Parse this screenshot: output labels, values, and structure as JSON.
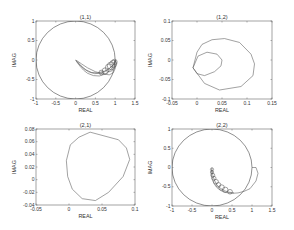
{
  "figure": {
    "width": 294,
    "height": 230,
    "background": "#ffffff",
    "line_color": "#555555"
  },
  "chart_data": [
    {
      "id": "p11",
      "type": "line",
      "title": "(1,1)",
      "xlabel": "REAL",
      "ylabel": "IMAG",
      "xlim": [
        -1,
        1.5
      ],
      "ylim": [
        -1,
        1
      ],
      "xticks": [
        -1,
        -0.5,
        0,
        0.5,
        1,
        1.5
      ],
      "xtick_labels": [
        "-1",
        "-0.5",
        "0",
        "0.5",
        "1",
        "1.5"
      ],
      "yticks": [
        -1,
        -0.5,
        0,
        0.5,
        1
      ],
      "ytick_labels": [
        "-1",
        "-0.5",
        "0",
        "0.5",
        "1"
      ],
      "grid": false,
      "box": {
        "left": 36,
        "top": 21,
        "right": 135,
        "bottom": 99
      },
      "unit_circle": true,
      "series": [
        {
          "name": "loci",
          "x": [
            0.0,
            0.05,
            0.12,
            0.2,
            0.3,
            0.45,
            0.6,
            0.75,
            0.88,
            0.97,
            1.0,
            1.02,
            1.0,
            0.95,
            0.85,
            0.7,
            0.5,
            0.3,
            0.15,
            0.05,
            0.0
          ],
          "y": [
            0.0,
            -0.08,
            -0.17,
            -0.26,
            -0.34,
            -0.4,
            -0.41,
            -0.36,
            -0.26,
            -0.13,
            0.0,
            -0.1,
            -0.22,
            -0.33,
            -0.38,
            -0.36,
            -0.3,
            -0.2,
            -0.1,
            -0.03,
            0.0
          ]
        },
        {
          "name": "loci-2",
          "x": [
            0.02,
            0.1,
            0.2,
            0.32,
            0.48,
            0.63,
            0.78,
            0.9,
            0.98,
            1.0
          ],
          "y": [
            -0.02,
            -0.12,
            -0.22,
            -0.3,
            -0.35,
            -0.34,
            -0.28,
            -0.18,
            -0.07,
            0.0
          ]
        },
        {
          "name": "loci-3",
          "x": [
            0.04,
            0.14,
            0.26,
            0.4,
            0.56,
            0.72,
            0.86,
            0.96,
            1.01
          ],
          "y": [
            -0.04,
            -0.15,
            -0.25,
            -0.32,
            -0.33,
            -0.29,
            -0.21,
            -0.11,
            -0.03
          ]
        }
      ],
      "small_circles": [
        {
          "cx": 0.85,
          "cy": -0.2,
          "r": 0.1
        },
        {
          "cx": 0.9,
          "cy": -0.15,
          "r": 0.1
        },
        {
          "cx": 0.95,
          "cy": -0.1,
          "r": 0.09
        },
        {
          "cx": 0.98,
          "cy": -0.05,
          "r": 0.07
        },
        {
          "cx": 0.75,
          "cy": -0.28,
          "r": 0.08
        },
        {
          "cx": 0.65,
          "cy": -0.32,
          "r": 0.06
        }
      ]
    },
    {
      "id": "p12",
      "type": "line",
      "title": "(1,2)",
      "xlabel": "REAL",
      "ylabel": "IMAG",
      "xlim": [
        -0.05,
        0.15
      ],
      "ylim": [
        -0.1,
        0.1
      ],
      "xticks": [
        -0.05,
        0,
        0.05,
        0.1,
        0.15
      ],
      "xtick_labels": [
        "-0.05",
        "0",
        "0.05",
        "0.1",
        "0.15"
      ],
      "yticks": [
        -0.1,
        -0.05,
        0,
        0.05,
        0.1
      ],
      "ytick_labels": [
        "-0.1",
        "-0.05",
        "0",
        "0.05",
        "0.1"
      ],
      "grid": false,
      "box": {
        "left": 172,
        "top": 21,
        "right": 272,
        "bottom": 99
      },
      "unit_circle": false,
      "series": [
        {
          "name": "outer-loop",
          "x": [
            -0.008,
            0.0,
            0.01,
            0.03,
            0.055,
            0.085,
            0.108,
            0.115,
            0.112,
            0.088,
            0.045,
            0.015,
            -0.008
          ],
          "y": [
            -0.02,
            0.02,
            0.04,
            0.052,
            0.055,
            0.045,
            0.015,
            -0.01,
            -0.04,
            -0.068,
            -0.077,
            -0.06,
            -0.02
          ]
        },
        {
          "name": "inner-loop",
          "x": [
            -0.008,
            0.002,
            0.02,
            0.04,
            0.05,
            0.048,
            0.035,
            0.015,
            0.0,
            -0.008
          ],
          "y": [
            -0.02,
            0.01,
            0.02,
            0.015,
            0.0,
            -0.015,
            -0.03,
            -0.04,
            -0.035,
            -0.02
          ]
        }
      ]
    },
    {
      "id": "p21",
      "type": "line",
      "title": "(2,1)",
      "xlabel": "REAL",
      "ylabel": "IMAG",
      "xlim": [
        -0.05,
        0.1
      ],
      "ylim": [
        -0.04,
        0.08
      ],
      "xticks": [
        -0.05,
        0,
        0.05,
        0.1
      ],
      "xtick_labels": [
        "-0.05",
        "0",
        "0.05",
        "0.1"
      ],
      "yticks": [
        -0.04,
        -0.02,
        0,
        0.02,
        0.04,
        0.06,
        0.08
      ],
      "ytick_labels": [
        "-0.04",
        "-0.02",
        "0",
        "0.02",
        "0.04",
        "0.06",
        "0.08"
      ],
      "grid": false,
      "box": {
        "left": 36,
        "top": 129,
        "right": 135,
        "bottom": 205
      },
      "unit_circle": false,
      "series": [
        {
          "name": "locus",
          "x": [
            0.002,
            0.015,
            0.032,
            0.075,
            0.087,
            0.092,
            0.082,
            0.06,
            0.04,
            0.02,
            0.005,
            -0.002,
            -0.004,
            0.002
          ],
          "y": [
            0.055,
            0.067,
            0.075,
            0.063,
            0.05,
            0.032,
            0.005,
            -0.02,
            -0.033,
            -0.03,
            -0.015,
            0.005,
            0.03,
            0.055
          ]
        }
      ]
    },
    {
      "id": "p22",
      "type": "line",
      "title": "(2,2)",
      "xlabel": "REAL",
      "ylabel": "IMAG",
      "xlim": [
        -1,
        1.5
      ],
      "ylim": [
        -1,
        1
      ],
      "xticks": [
        -1,
        -0.5,
        0,
        0.5,
        1,
        1.5
      ],
      "xtick_labels": [
        "-1",
        "-0.5",
        "0",
        "0.5",
        "1",
        "1.5"
      ],
      "yticks": [
        -1,
        -0.5,
        0,
        0.5,
        1
      ],
      "ytick_labels": [
        "-1",
        "-0.5",
        "0",
        "0.5",
        "1"
      ],
      "grid": false,
      "box": {
        "left": 172,
        "top": 129,
        "right": 272,
        "bottom": 206
      },
      "unit_circle": true,
      "series": [
        {
          "name": "loci",
          "x": [
            0.0,
            -0.02,
            0.0,
            0.05,
            0.12,
            0.22,
            0.35,
            0.5,
            0.65,
            0.8,
            0.95,
            1.1,
            1.15,
            1.1,
            1.0
          ],
          "y": [
            0.0,
            -0.15,
            -0.3,
            -0.42,
            -0.52,
            -0.6,
            -0.65,
            -0.67,
            -0.66,
            -0.62,
            -0.55,
            -0.35,
            -0.15,
            0.0,
            0.0
          ]
        },
        {
          "name": "loci-2",
          "x": [
            0.0,
            0.02,
            0.06,
            0.12,
            0.2,
            0.3,
            0.42,
            0.55
          ],
          "y": [
            -0.05,
            -0.2,
            -0.33,
            -0.45,
            -0.53,
            -0.6,
            -0.64,
            -0.66
          ]
        }
      ],
      "small_circles": [
        {
          "cx": 0.0,
          "cy": -0.05,
          "r": 0.04
        },
        {
          "cx": 0.0,
          "cy": -0.12,
          "r": 0.04
        },
        {
          "cx": 0.02,
          "cy": -0.2,
          "r": 0.05
        },
        {
          "cx": 0.05,
          "cy": -0.28,
          "r": 0.05
        },
        {
          "cx": 0.1,
          "cy": -0.37,
          "r": 0.06
        },
        {
          "cx": 0.16,
          "cy": -0.45,
          "r": 0.06
        },
        {
          "cx": 0.24,
          "cy": -0.52,
          "r": 0.07
        },
        {
          "cx": 0.33,
          "cy": -0.58,
          "r": 0.07
        },
        {
          "cx": 0.45,
          "cy": -0.63,
          "r": 0.06
        }
      ]
    }
  ]
}
